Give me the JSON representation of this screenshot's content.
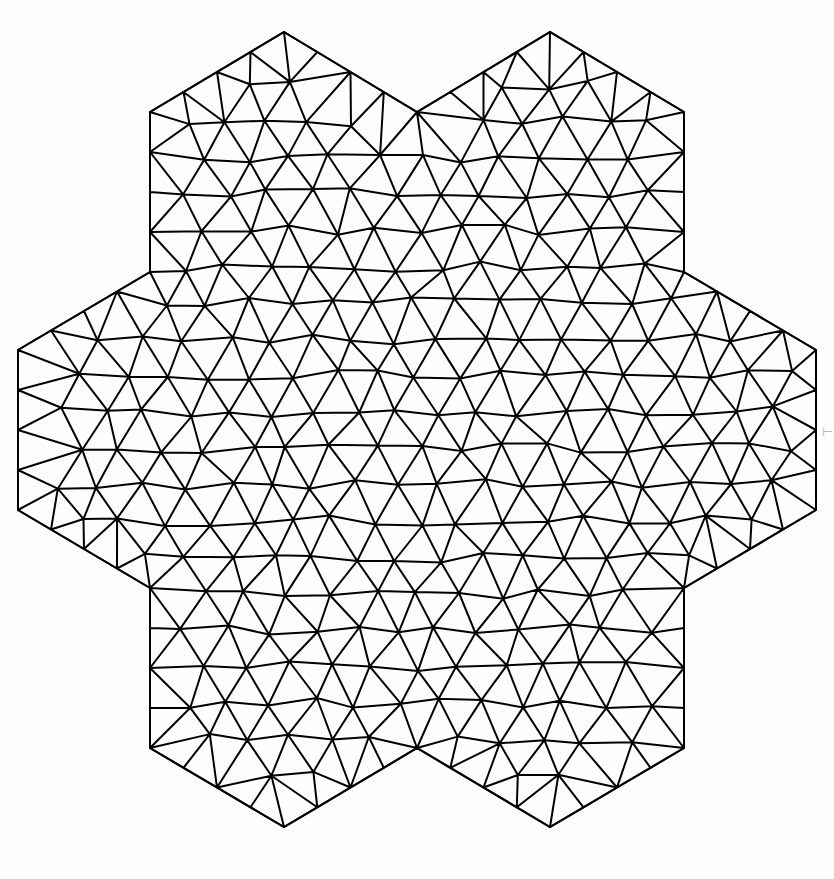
{
  "figure": {
    "domain_name": "hexagram",
    "width": 834,
    "height": 879,
    "background_color": "#fdfdfd",
    "edge_color": "#000000",
    "edge_width_px": 2.0,
    "vertex_marker": "none",
    "fill": "none",
    "mesh_type": "unstructured-triangular",
    "symmetry": "6-fold rotational",
    "approx_elements": 980,
    "approx_nodes": 520,
    "typical_edge_length_px": 42
  },
  "geometry": {
    "center": {
      "x": 417.0,
      "y": 430.0
    },
    "outer_radius_px": 398.0,
    "inner_radius_px": 230.0,
    "rotation_deg": 0.0,
    "star_points": 6,
    "outer_vertices": [
      {
        "label": "top-left-point",
        "x": 284.0,
        "y": 32.0
      },
      {
        "label": "top-right-point",
        "x": 550.0,
        "y": 32.0
      },
      {
        "label": "right-point",
        "x": 816.0,
        "y": 430.0
      },
      {
        "label": "bottom-right-point",
        "x": 550.0,
        "y": 827.0
      },
      {
        "label": "bottom-left-point",
        "x": 284.0,
        "y": 827.0
      },
      {
        "label": "left-point",
        "x": 18.0,
        "y": 430.0
      }
    ],
    "inner_vertices": [
      {
        "label": "upper-notch-left",
        "x": 150.0,
        "y": 112.0
      },
      {
        "label": "upper-mid",
        "x": 417.0,
        "y": 112.0
      },
      {
        "label": "upper-notch-right",
        "x": 684.0,
        "y": 112.0
      },
      {
        "label": "right-upper",
        "x": 684.0,
        "y": 272.0
      },
      {
        "label": "right-lower",
        "x": 816.0,
        "y": 350.0
      },
      {
        "label": "lower-notch-right",
        "x": 684.0,
        "y": 748.0
      },
      {
        "label": "lower-mid",
        "x": 417.0,
        "y": 748.0
      },
      {
        "label": "lower-notch-left",
        "x": 150.0,
        "y": 748.0
      },
      {
        "label": "left-lower",
        "x": 18.0,
        "y": 510.0
      },
      {
        "label": "left-upper",
        "x": 150.0,
        "y": 272.0
      }
    ]
  },
  "chart_data": {
    "type": "mesh",
    "subtitle": "",
    "xlabel": "",
    "ylabel": "",
    "legend": [],
    "annotations": [],
    "grid": false,
    "axes_visible": false,
    "tick_labels_x": [],
    "tick_labels_y": [],
    "xlim": [
      0,
      834
    ],
    "ylim": [
      0,
      879
    ],
    "series": [
      {
        "name": "mesh-edges",
        "color": "#000000",
        "line_width": 2.0,
        "element_count": 980
      }
    ],
    "boundary_polygon": [
      [
        284,
        32
      ],
      [
        417,
        112
      ],
      [
        550,
        32
      ],
      [
        684,
        112
      ],
      [
        684,
        272
      ],
      [
        816,
        350
      ],
      [
        816,
        510
      ],
      [
        684,
        588
      ],
      [
        684,
        748
      ],
      [
        550,
        827
      ],
      [
        417,
        748
      ],
      [
        284,
        827
      ],
      [
        150,
        748
      ],
      [
        150,
        588
      ],
      [
        18,
        510
      ],
      [
        18,
        350
      ],
      [
        150,
        272
      ],
      [
        150,
        112
      ]
    ]
  },
  "overlay": {
    "edge_marker_glyph": "⊢",
    "edge_marker_visible": true
  }
}
